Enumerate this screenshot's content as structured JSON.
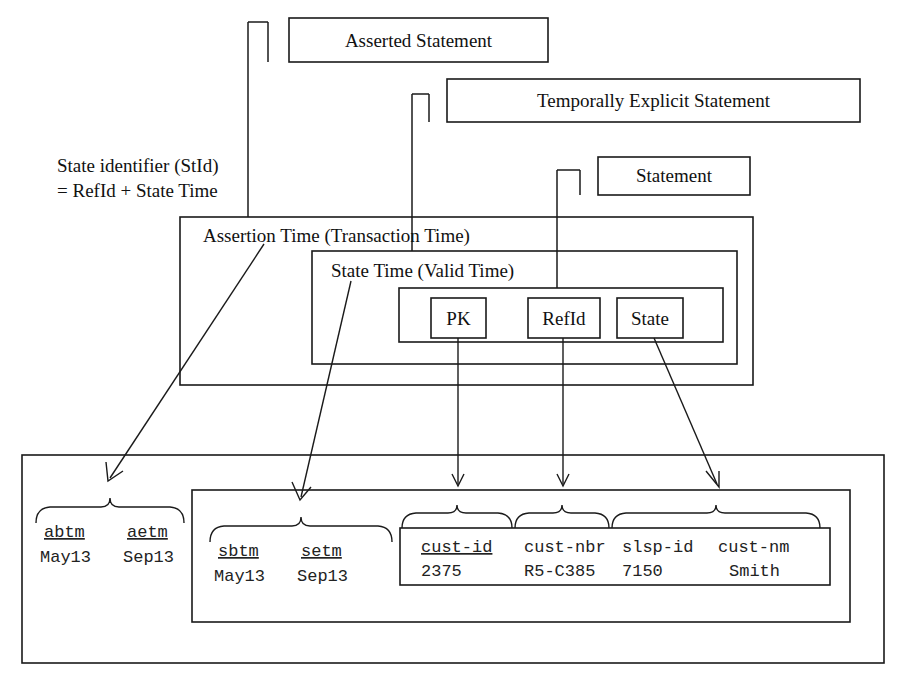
{
  "diagram": {
    "title_note": {
      "line1": "State identifier (StId)",
      "line2": "= RefId + State Time"
    },
    "top_boxes": [
      {
        "id": "asserted-statement",
        "label": "Asserted Statement"
      },
      {
        "id": "temporally-explicit-statement",
        "label": "Temporally Explicit Statement"
      },
      {
        "id": "statement",
        "label": "Statement"
      }
    ],
    "containers": [
      {
        "id": "assertion-time",
        "label": "Assertion Time (Transaction Time)"
      },
      {
        "id": "state-time",
        "label": "State Time (Valid Time)"
      }
    ],
    "attribute_boxes": [
      {
        "id": "pk",
        "label": "PK"
      },
      {
        "id": "refid",
        "label": "RefId"
      },
      {
        "id": "state",
        "label": "State"
      }
    ],
    "data_groups": [
      {
        "id": "assertion-time-values",
        "columns": [
          {
            "header": "abtm",
            "value": "May13",
            "underlined": true
          },
          {
            "header": "aetm",
            "value": "Sep13",
            "underlined": true
          }
        ]
      },
      {
        "id": "state-time-values",
        "columns": [
          {
            "header": "sbtm",
            "value": "May13",
            "underlined": true
          },
          {
            "header": "setm",
            "value": "Sep13",
            "underlined": true
          }
        ]
      },
      {
        "id": "statement-values",
        "columns": [
          {
            "header": "cust-id",
            "value": "2375",
            "underlined": true
          },
          {
            "header": "cust-nbr",
            "value": "R5-C385",
            "underlined": false
          },
          {
            "header": "slsp-id",
            "value": "7150",
            "underlined": false
          },
          {
            "header": "cust-nm",
            "value": "Smith",
            "underlined": false
          }
        ]
      }
    ],
    "colors": {
      "ink": "#1a1a1a",
      "paper": "#ffffff"
    }
  }
}
